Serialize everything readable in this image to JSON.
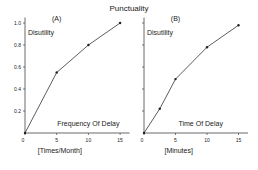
{
  "figure": {
    "title": "Punctuality"
  },
  "chart_data": [
    {
      "type": "line",
      "panel_label": "(A)",
      "title": "Frequency Of Delay",
      "xlabel": "[Times/Month]",
      "ylabel": "Disutility",
      "x": [
        0,
        5,
        10,
        15
      ],
      "values": [
        0,
        0.55,
        0.8,
        1.0
      ],
      "xticks": [
        0,
        5,
        10,
        15
      ],
      "yticks": [
        0.2,
        0.4,
        0.6,
        0.8,
        1.0
      ],
      "xlim": [
        0,
        16
      ],
      "ylim": [
        0,
        1.05
      ],
      "grid": false
    },
    {
      "type": "line",
      "panel_label": "(B)",
      "title": "Time Of Delay",
      "xlabel": "[Minutes]",
      "ylabel": "Disutility",
      "x": [
        0,
        2.5,
        5,
        10,
        15
      ],
      "values": [
        0,
        0.22,
        0.49,
        0.78,
        0.98
      ],
      "xticks": [
        0,
        5,
        10,
        15
      ],
      "yticks": [
        0.2,
        0.4,
        0.6,
        0.8,
        1.0
      ],
      "xlim": [
        0,
        16
      ],
      "ylim": [
        0,
        1.05
      ],
      "grid": false
    }
  ]
}
